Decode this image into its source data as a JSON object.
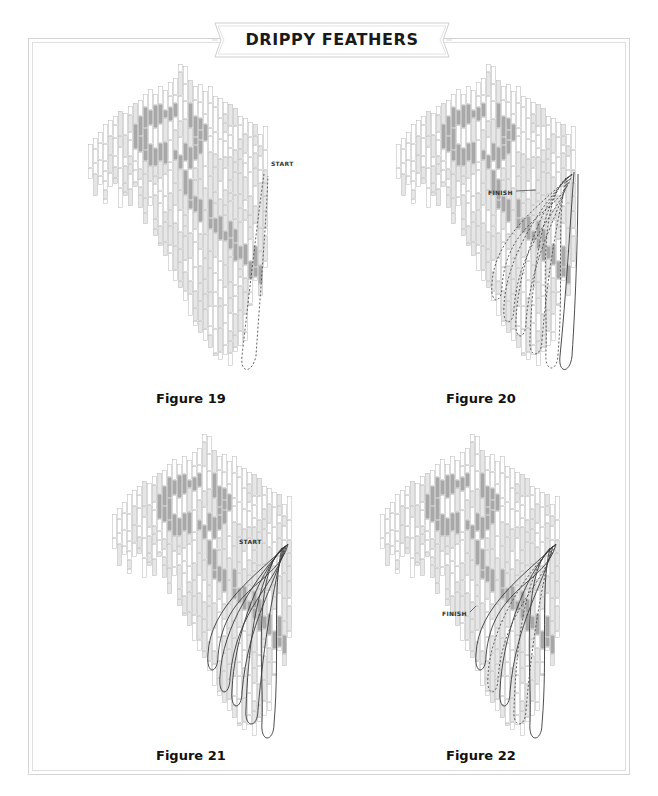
{
  "title": "DRIPPY FEATHERS",
  "colors": {
    "white": "#ffffff",
    "light": "#e6e6e6",
    "medium": "#c2c2c2",
    "dark": "#a8a8a8",
    "stroke": "#b5b5b5",
    "path": "#3a3a3a",
    "frame": "#d4d4d4"
  },
  "figures": [
    {
      "id": "fig19",
      "caption": "Figure 19",
      "label": "START",
      "overlay": "single-dashed"
    },
    {
      "id": "fig20",
      "caption": "Figure 20",
      "label": "FINISH",
      "overlay": "multi-dashed"
    },
    {
      "id": "fig21",
      "caption": "Figure 21",
      "label": "START",
      "overlay": "multi-solid"
    },
    {
      "id": "fig22",
      "caption": "Figure 22",
      "label": "FINISH",
      "overlay": "multi-solid-dashed"
    }
  ],
  "pattern": {
    "strip_width": 5,
    "columns": [
      {
        "top": 88,
        "bottom": 123
      },
      {
        "top": 82,
        "bottom": 140
      },
      {
        "top": 76,
        "bottom": 130
      },
      {
        "top": 68,
        "bottom": 148
      },
      {
        "top": 64,
        "bottom": 131
      },
      {
        "top": 60,
        "bottom": 128
      },
      {
        "top": 55,
        "bottom": 152
      },
      {
        "top": 57,
        "bottom": 140
      },
      {
        "top": 50,
        "bottom": 150
      },
      {
        "top": 47,
        "bottom": 131
      },
      {
        "top": 44,
        "bottom": 152
      },
      {
        "top": 38,
        "bottom": 168
      },
      {
        "top": 33,
        "bottom": 150
      },
      {
        "top": 38,
        "bottom": 180
      },
      {
        "top": 30,
        "bottom": 190
      },
      {
        "top": 34,
        "bottom": 200
      },
      {
        "top": 26,
        "bottom": 215
      },
      {
        "top": 22,
        "bottom": 225
      },
      {
        "top": 8,
        "bottom": 232
      },
      {
        "top": 10,
        "bottom": 245
      },
      {
        "top": 24,
        "bottom": 260
      },
      {
        "top": 30,
        "bottom": 270
      },
      {
        "top": 28,
        "bottom": 278
      },
      {
        "top": 35,
        "bottom": 285
      },
      {
        "top": 30,
        "bottom": 292
      },
      {
        "top": 40,
        "bottom": 300
      },
      {
        "top": 42,
        "bottom": 305
      },
      {
        "top": 46,
        "bottom": 300
      },
      {
        "top": 48,
        "bottom": 310
      },
      {
        "top": 52,
        "bottom": 296
      },
      {
        "top": 60,
        "bottom": 290
      },
      {
        "top": 62,
        "bottom": 285
      },
      {
        "top": 66,
        "bottom": 250
      },
      {
        "top": 68,
        "bottom": 225
      },
      {
        "top": 78,
        "bottom": 240
      },
      {
        "top": 70,
        "bottom": 212
      }
    ]
  }
}
